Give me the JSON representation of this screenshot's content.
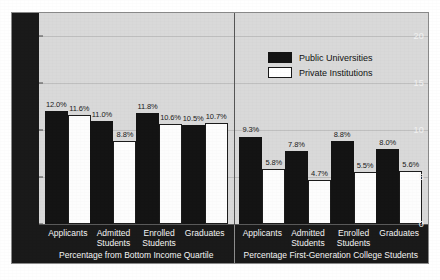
{
  "chart_data": {
    "type": "bar",
    "title": "",
    "xlabel": "",
    "ylabel": "",
    "ylim": [
      0,
      22
    ],
    "yticks": [
      0,
      5,
      10,
      15,
      20
    ],
    "grid": true,
    "legend_position": "top-right",
    "value_suffix": "%",
    "categories": [
      "Applicants",
      "Admitted Students",
      "Enrolled Students",
      "Graduates"
    ],
    "series": [
      {
        "name": "Public Universities",
        "color": "#141414"
      },
      {
        "name": "Private Institutions",
        "color": "#ffffff"
      }
    ],
    "panels": [
      {
        "title": "Percentage from Bottom Income Quartile",
        "categories": [
          "Applicants",
          "Admitted Students",
          "Enrolled Students",
          "Graduates"
        ],
        "series": [
          {
            "name": "Public Universities",
            "values": [
              12.0,
              11.0,
              11.8,
              10.5
            ]
          },
          {
            "name": "Private Institutions",
            "values": [
              11.6,
              8.8,
              10.6,
              10.7
            ]
          }
        ],
        "labels": [
          [
            "12.0%",
            "11.0%",
            "11.8%",
            "10.5%"
          ],
          [
            "11.6%",
            "8.8%",
            "10.6%",
            "10.7%"
          ]
        ]
      },
      {
        "title": "Percentage First-Generation College Students",
        "categories": [
          "Applicants",
          "Admitted Students",
          "Enrolled Students",
          "Graduates"
        ],
        "series": [
          {
            "name": "Public Universities",
            "values": [
              9.3,
              7.8,
              8.8,
              8.0
            ]
          },
          {
            "name": "Private Institutions",
            "values": [
              5.8,
              4.7,
              5.5,
              5.6
            ]
          }
        ],
        "labels": [
          [
            "9.3%",
            "7.8%",
            "8.8%",
            "8.0%"
          ],
          [
            "5.8%",
            "4.7%",
            "5.5%",
            "5.6%"
          ]
        ]
      }
    ]
  },
  "axis": {
    "tick_labels": [
      "0",
      "5",
      "10",
      "15",
      "20"
    ]
  },
  "legend": {
    "items": [
      {
        "label": "Public Universities",
        "swatch": "public"
      },
      {
        "label": "Private Institutions",
        "swatch": "private"
      }
    ]
  },
  "category_lines": {
    "applicants": [
      "Applicants"
    ],
    "admitted": [
      "Admitted",
      "Students"
    ],
    "enrolled": [
      "Enrolled",
      "Students"
    ],
    "graduates": [
      "Graduates"
    ]
  }
}
